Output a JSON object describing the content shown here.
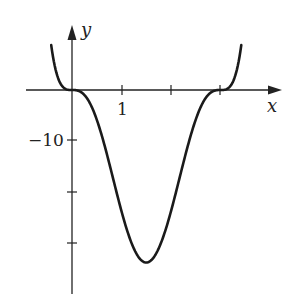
{
  "chart_data": {
    "type": "line",
    "title": "",
    "xlabel": "x",
    "ylabel": "y",
    "x_ticks": [
      1,
      2,
      3
    ],
    "x_tick_labels": [
      "1",
      "",
      ""
    ],
    "y_ticks": [
      -10,
      -20,
      -30
    ],
    "y_tick_labels": [
      "−10",
      "",
      ""
    ],
    "xlim": [
      -0.9,
      4.2
    ],
    "ylim": [
      -41,
      14
    ],
    "grid": false,
    "legend": null,
    "series": [
      {
        "name": "f(x)",
        "x": [
          -0.42,
          -0.3,
          -0.2,
          -0.1,
          0,
          0.25,
          0.5,
          0.75,
          1.0,
          1.25,
          1.5,
          1.75,
          2.0,
          2.25,
          2.5,
          2.75,
          3.0,
          3.1,
          3.2,
          3.3,
          3.42
        ],
        "y": [
          10.0,
          3.0,
          0.8,
          0.1,
          0,
          -0.9,
          -5.9,
          -14.1,
          -24.0,
          -31.4,
          -34.2,
          -31.4,
          -24.0,
          -14.1,
          -5.9,
          -0.9,
          0,
          0.1,
          0.8,
          3.0,
          10.0
        ]
      }
    ],
    "annotations": []
  },
  "labels": {
    "x_axis": "x",
    "y_axis": "y",
    "x_tick_1": "1",
    "y_tick_neg10": "−10"
  }
}
